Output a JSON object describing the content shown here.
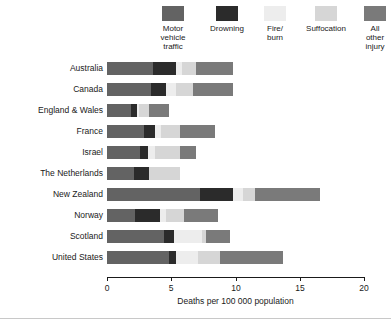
{
  "chart_data": {
    "type": "bar",
    "orientation": "horizontal",
    "stacked": true,
    "title": "",
    "xlabel": "Deaths per 100 000 population",
    "ylabel": "",
    "xlim": [
      0,
      20
    ],
    "xticks": [
      0,
      5,
      10,
      15,
      20
    ],
    "xticklabels": [
      "0",
      "5",
      "10",
      "15",
      "20"
    ],
    "grid": false,
    "legend_position": "top",
    "categories": [
      "Australia",
      "Canada",
      "England & Wales",
      "France",
      "Israel",
      "The Netherlands",
      "New Zealand",
      "Norway",
      "Scotland",
      "United States"
    ],
    "series": [
      {
        "name": "Motor vehicle traffic",
        "color": "#636363",
        "values": [
          3.6,
          3.4,
          1.9,
          2.9,
          2.6,
          2.1,
          7.2,
          2.2,
          4.4,
          4.8
        ]
      },
      {
        "name": "Drowning",
        "color": "#2b2b2b",
        "values": [
          1.8,
          1.2,
          0.4,
          0.8,
          0.6,
          1.2,
          2.6,
          1.9,
          0.8,
          0.6
        ]
      },
      {
        "name": "Fire/ burn",
        "color": "#ededed",
        "values": [
          0.4,
          0.8,
          0.2,
          0.5,
          0.5,
          0.0,
          0.8,
          0.5,
          2.2,
          1.7
        ]
      },
      {
        "name": "Suffocation",
        "color": "#d6d6d6",
        "values": [
          1.1,
          1.3,
          0.8,
          1.5,
          2.0,
          2.4,
          0.9,
          1.4,
          0.3,
          1.7
        ]
      },
      {
        "name": "All other injury",
        "color": "#7a7a7a",
        "values": [
          2.9,
          3.1,
          1.5,
          2.7,
          1.2,
          0.0,
          5.1,
          2.6,
          1.9,
          4.9
        ]
      }
    ],
    "totals": [
      9.8,
      9.8,
      4.8,
      8.4,
      6.9,
      5.7,
      16.6,
      8.6,
      9.6,
      13.7
    ]
  },
  "legend": {
    "items": [
      {
        "label": "Motor\nvehicle\ntraffic",
        "swatch": "legend-swatch-motor-vehicle-traffic"
      },
      {
        "label": "Drowning",
        "swatch": "legend-swatch-drowning"
      },
      {
        "label": "Fire/\nburn",
        "swatch": "legend-swatch-fire-burn"
      },
      {
        "label": "Suffocation",
        "swatch": "legend-swatch-suffocation"
      },
      {
        "label": "All\nother\ninjury",
        "swatch": "legend-swatch-all-other-injury"
      }
    ]
  },
  "axis": {
    "x_title": "Deaths per 100 000 population",
    "tick_0": "0",
    "tick_1": "5",
    "tick_2": "10",
    "tick_3": "15",
    "tick_4": "20"
  },
  "ylabels": {
    "c0": "Australia",
    "c1": "Canada",
    "c2": "England & Wales",
    "c3": "France",
    "c4": "Israel",
    "c5": "The Netherlands",
    "c6": "New Zealand",
    "c7": "Norway",
    "c8": "Scotland",
    "c9": "United States"
  }
}
